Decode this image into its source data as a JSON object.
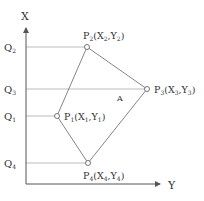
{
  "axes": {
    "vertical_label": "X",
    "horizontal_label": "Y",
    "color": "#555555"
  },
  "ticks": [
    {
      "label": "Q",
      "sub": "2",
      "y": 47
    },
    {
      "label": "Q",
      "sub": "3",
      "y": 89
    },
    {
      "label": "Q",
      "sub": "1",
      "y": 116
    },
    {
      "label": "Q",
      "sub": "4",
      "y": 163
    }
  ],
  "points": [
    {
      "id": "P1",
      "name": "P",
      "sub": "1",
      "coords_open": "(X",
      "xs": "1",
      "comma": ",Y",
      "ys": "1",
      "close": ")",
      "x": 57,
      "y": 116
    },
    {
      "id": "P2",
      "name": "P",
      "sub": "2",
      "coords_open": "(X",
      "xs": "2",
      "comma": ",Y",
      "ys": "2",
      "close": ")",
      "x": 87,
      "y": 47
    },
    {
      "id": "P3",
      "name": "P",
      "sub": "3",
      "coords_open": "(X",
      "xs": "3",
      "comma": ",Y",
      "ys": "3",
      "close": ")",
      "x": 147,
      "y": 89
    },
    {
      "id": "P4",
      "name": "P",
      "sub": "4",
      "coords_open": "(X",
      "xs": "4",
      "comma": ",Y",
      "ys": "4",
      "close": ")",
      "x": 88,
      "y": 163
    }
  ],
  "region_label": "A"
}
